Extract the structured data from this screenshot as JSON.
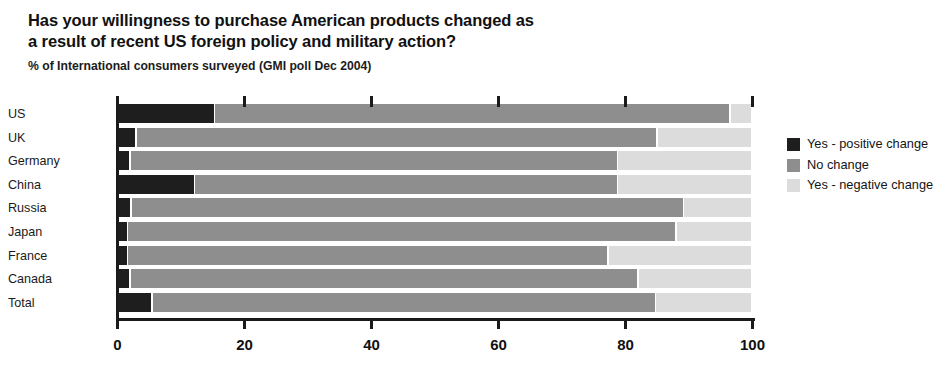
{
  "heading": {
    "title_line_1": "Has your willingness to purchase American products changed as",
    "title_line_2": "a result of recent US foreign policy and military action?",
    "subtitle": "% of International consumers surveyed (GMI poll Dec 2004)"
  },
  "legend": {
    "items": [
      {
        "label": "Yes - positive change",
        "color": "#1e1e1e",
        "swatch_name": "legend-swatch-positive"
      },
      {
        "label": "No change",
        "color": "#8e8e8e",
        "swatch_name": "legend-swatch-no-change"
      },
      {
        "label": "Yes - negative change",
        "color": "#dcdcdc",
        "swatch_name": "legend-swatch-negative"
      }
    ]
  },
  "chart_data": {
    "type": "bar",
    "orientation": "horizontal",
    "stacked": true,
    "stack_total": 100,
    "title": "Has your willingness to purchase American products changed as a result of recent US foreign policy and military action?",
    "subtitle": "% of International consumers surveyed (GMI poll Dec 2004)",
    "xlabel": "",
    "ylabel": "",
    "xlim": [
      0,
      100
    ],
    "xticks": [
      0,
      20,
      40,
      60,
      80,
      100
    ],
    "xticklabels": [
      "0",
      "20",
      "40",
      "60",
      "80",
      "100"
    ],
    "grid": false,
    "legend_position": "right",
    "categories": [
      "US",
      "UK",
      "Germany",
      "China",
      "Russia",
      "Japan",
      "France",
      "Canada",
      "Total"
    ],
    "series": [
      {
        "name": "Yes - positive change",
        "color": "#1e1e1e",
        "values": [
          15.3,
          3.0,
          2.0,
          12.2,
          2.2,
          1.6,
          1.6,
          2.0,
          5.5
        ]
      },
      {
        "name": "No change",
        "color": "#8e8e8e",
        "values": [
          81.2,
          82.0,
          76.8,
          66.6,
          87.0,
          86.4,
          75.7,
          80.0,
          79.3
        ]
      },
      {
        "name": "Yes - negative change",
        "color": "#dcdcdc",
        "values": [
          3.5,
          15.0,
          21.2,
          21.2,
          10.8,
          12.0,
          22.7,
          18.0,
          15.2
        ]
      }
    ]
  }
}
